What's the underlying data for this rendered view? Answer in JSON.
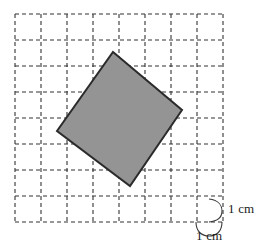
{
  "figure": {
    "type": "geometry-diagram",
    "canvas": {
      "width": 261,
      "height": 251,
      "background": "#ffffff"
    }
  },
  "grid": {
    "name": "centimetre-grid",
    "columns": 8,
    "rows": 8,
    "cell_size_px": 26,
    "origin_x": 15,
    "origin_y": 14,
    "line_color": "#333333",
    "line_style": "dashed",
    "dash_pattern": "4 3",
    "line_width": 1.1,
    "unit": "1 cm"
  },
  "shape": {
    "name": "shaded-square",
    "kind": "square",
    "fill_color": "#949494",
    "stroke_color": "#2b2b2b",
    "stroke_width": 2,
    "vertices": [
      {
        "label": "top",
        "x": 113,
        "y": 52
      },
      {
        "label": "right",
        "x": 182,
        "y": 110
      },
      {
        "label": "bottom",
        "x": 130,
        "y": 186
      },
      {
        "label": "left",
        "x": 57,
        "y": 131
      }
    ],
    "points_attr": "113,52 182,110 130,186 57,131"
  },
  "annotations": {
    "vertical_brace": {
      "name": "vertical-unit-brace",
      "path": "M 209 199 C 219 200, 222 206, 222 211 C 222 216, 219 221, 209 222",
      "stroke_color": "#3a3a3a",
      "stroke_width": 1.1
    },
    "horizontal_brace": {
      "name": "horizontal-unit-brace",
      "path": "M 196 222 C 196 232, 202 236, 209 236 C 216 236, 222 232, 222 222",
      "stroke_color": "#3a3a3a",
      "stroke_width": 1.1
    },
    "vertical_label": "1 cm",
    "horizontal_label": "1 cm"
  }
}
